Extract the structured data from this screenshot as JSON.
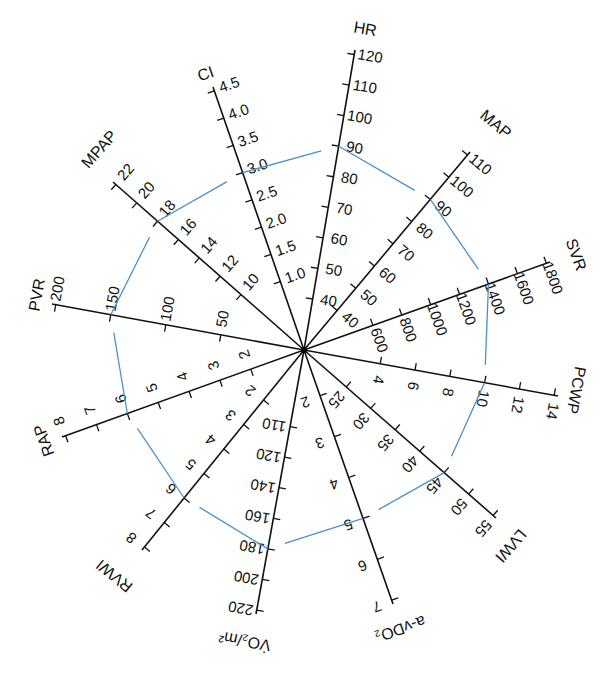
{
  "chart_data": {
    "type": "radar",
    "title": "",
    "center": [
      304,
      350
    ],
    "polygon_color": "#4a90c8",
    "axis_color": "#111111",
    "axes": [
      {
        "label": "HR",
        "end": [
          355,
          50
        ],
        "ticks": [
          40,
          50,
          60,
          70,
          80,
          90,
          100,
          110,
          120
        ],
        "t0": 0.17,
        "value": 90,
        "label_pos": [
          365,
          30
        ]
      },
      {
        "label": "MAP",
        "end": [
          470,
          152
        ],
        "ticks": [
          40,
          50,
          60,
          70,
          80,
          90,
          100,
          110
        ],
        "t0": 0.2,
        "value": 90,
        "label_pos": [
          495,
          125
        ]
      },
      {
        "label": "SVR",
        "end": [
          550,
          262
        ],
        "ticks": [
          600,
          800,
          1000,
          1200,
          1400,
          1600,
          1800
        ],
        "t0": 0.28,
        "value": 1400,
        "label_pos": [
          575,
          255
        ]
      },
      {
        "label": "PCWP",
        "end": [
          558,
          396
        ],
        "ticks": [
          4,
          6,
          8,
          10,
          12,
          14
        ],
        "t0": 0.3,
        "value": 10,
        "label_pos": [
          575,
          390
        ]
      },
      {
        "label": "LVWI",
        "end": [
          496,
          518
        ],
        "ticks": [
          25,
          30,
          35,
          40,
          45,
          50,
          55
        ],
        "t0": 0.22,
        "value": 45,
        "label_pos": [
          510,
          545
        ]
      },
      {
        "label": "a-vDO₂",
        "end": [
          393,
          604
        ],
        "ticks": [
          2,
          3,
          4,
          5,
          6,
          7
        ],
        "t0": 0.18,
        "value": 5,
        "label_pos": [
          400,
          628
        ]
      },
      {
        "label": "V̇O₂/m²",
        "end": [
          256,
          614
        ],
        "ticks": [
          110,
          120,
          140,
          160,
          180,
          200,
          220
        ],
        "t0": 0.29,
        "value": 180,
        "label_pos": [
          245,
          640
        ]
      },
      {
        "label": "RVWI",
        "end": [
          142,
          550
        ],
        "ticks": [
          2,
          3,
          4,
          5,
          6,
          7,
          8
        ],
        "t0": 0.25,
        "value": 6,
        "label_pos": [
          115,
          575
        ]
      },
      {
        "label": "RAP",
        "end": [
          62,
          437
        ],
        "ticks": [
          2,
          3,
          4,
          5,
          6,
          7,
          8
        ],
        "t0": 0.22,
        "value": 6,
        "label_pos": [
          45,
          440
        ]
      },
      {
        "label": "PVR",
        "end": [
          52,
          304
        ],
        "ticks": [
          50,
          100,
          150,
          200
        ],
        "t0": 0.33,
        "value": 150,
        "label_pos": [
          38,
          295
        ]
      },
      {
        "label": "MPAP",
        "end": [
          113,
          182
        ],
        "ticks": [
          10,
          12,
          14,
          16,
          18,
          20,
          22
        ],
        "t0": 0.33,
        "value": 18,
        "label_pos": [
          100,
          150
        ]
      },
      {
        "label": "CI",
        "end": [
          213,
          87
        ],
        "ticks": [
          1.0,
          1.5,
          2.0,
          2.5,
          3.0,
          3.5,
          4.0,
          4.5
        ],
        "t0": 0.26,
        "value": 3.0,
        "label_pos": [
          206,
          75
        ]
      }
    ],
    "data_points": {
      "HR": 90,
      "MAP": 90,
      "SVR": 1400,
      "PCWP": 10,
      "LVWI": 45,
      "a-vDO2": 5,
      "VO2/m2": 180,
      "RVWI": 6,
      "RAP": 6,
      "PVR": 150,
      "MPAP": 18,
      "CI": 3.0
    }
  }
}
